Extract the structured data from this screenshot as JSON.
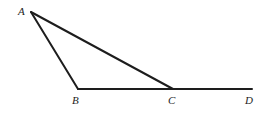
{
  "figure": {
    "type": "geometry-diagram",
    "background_color": "#ffffff",
    "stroke_color": "#1d1d1d",
    "stroke_width": 2,
    "canvas": {
      "width": 268,
      "height": 113
    },
    "points": {
      "A": {
        "label": "A",
        "x": 31,
        "y": 12
      },
      "B": {
        "label": "B",
        "x": 78,
        "y": 89
      },
      "C": {
        "label": "C",
        "x": 173,
        "y": 89
      },
      "D": {
        "label": "D",
        "x": 252,
        "y": 89
      }
    },
    "segments": [
      {
        "name": "segment-ab",
        "from": "A",
        "to": "B"
      },
      {
        "name": "segment-ac",
        "from": "A",
        "to": "C"
      },
      {
        "name": "segment-bd",
        "from": "B",
        "to": "D"
      }
    ],
    "labels": {
      "a": "A",
      "b": "B",
      "c": "C",
      "d": "D"
    }
  }
}
